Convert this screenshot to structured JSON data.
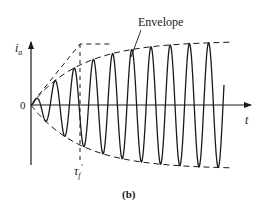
{
  "figure": {
    "caption": "(b)",
    "envelope_label": "Envelope",
    "y_axis_label": "i",
    "y_axis_subscript": "a",
    "x_axis_label": "t",
    "origin_label": "0",
    "time_constant_label": "τ",
    "time_constant_subscript": "f",
    "time_constant_prime": "′",
    "colors": {
      "line": "#1a1a1a",
      "background": "#ffffff"
    }
  },
  "chart_data": {
    "type": "line",
    "title": "",
    "xlabel": "t",
    "ylabel": "i_a",
    "series": [
      {
        "name": "i_a (oscillation)",
        "style": "solid"
      },
      {
        "name": "Envelope (upper/lower)",
        "style": "dashed"
      },
      {
        "name": "Initial-slope tangent",
        "style": "dashed"
      }
    ],
    "annotations": [
      "Envelope",
      "τf′",
      "0",
      "(b)"
    ],
    "cycles_visible": 11
  }
}
